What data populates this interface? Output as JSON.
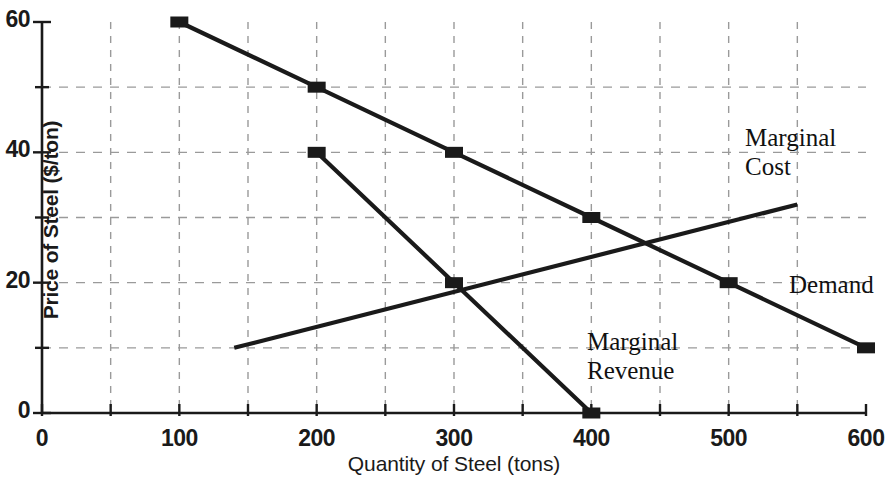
{
  "chart_data": {
    "type": "line",
    "title": "",
    "xlabel": "Quantity of Steel (tons)",
    "ylabel": "Price of Steel ($/ton)",
    "xlim": [
      0,
      600
    ],
    "ylim": [
      0,
      60
    ],
    "x_ticks": [
      0,
      100,
      200,
      300,
      400,
      500,
      600
    ],
    "x_tick_labels": [
      "0",
      "100",
      "200",
      "300",
      "400",
      "500",
      "600"
    ],
    "x_minor_ticks": [
      50,
      150,
      250,
      350,
      450,
      550
    ],
    "y_ticks": [
      0,
      20,
      40,
      60
    ],
    "y_tick_labels": [
      "0",
      "20",
      "40",
      "60"
    ],
    "y_minor_ticks": [
      10,
      30,
      50
    ],
    "grid": true,
    "grid_style": "dashed",
    "grid_x": [
      50,
      100,
      150,
      200,
      250,
      300,
      350,
      400,
      450,
      500,
      550
    ],
    "grid_y": [
      10,
      20,
      30,
      40,
      50
    ],
    "legend_position": "inline-annotations",
    "series": [
      {
        "name": "Demand",
        "marker": "square",
        "x": [
          100,
          200,
          300,
          400,
          500,
          600
        ],
        "values": [
          60,
          50,
          40,
          30,
          20,
          10
        ]
      },
      {
        "name": "Marginal Revenue",
        "marker": "square",
        "x": [
          200,
          300,
          400
        ],
        "values": [
          40,
          20,
          0
        ]
      },
      {
        "name": "Marginal Cost",
        "marker": "none",
        "x": [
          140,
          550
        ],
        "values": [
          10,
          32
        ]
      }
    ],
    "annotations": [
      {
        "text": "Marginal\nCost",
        "x": 515,
        "y": 47
      },
      {
        "text": "Demand",
        "x": 545,
        "y": 21
      },
      {
        "text": "Marginal\nRevenue",
        "x": 398,
        "y": 13
      }
    ]
  },
  "axes": {
    "y_title": "Price of Steel ($/ton)",
    "x_title": "Quantity of Steel (tons)"
  },
  "ticks": {
    "y": [
      {
        "label": "60",
        "value": 60
      },
      {
        "label": "40",
        "value": 40
      },
      {
        "label": "20",
        "value": 20
      },
      {
        "label": "0",
        "value": 0
      }
    ],
    "x": [
      {
        "label": "0",
        "value": 0
      },
      {
        "label": "100",
        "value": 100
      },
      {
        "label": "200",
        "value": 200
      },
      {
        "label": "300",
        "value": 300
      },
      {
        "label": "400",
        "value": 400
      },
      {
        "label": "500",
        "value": 500
      },
      {
        "label": "600",
        "value": 600
      }
    ]
  },
  "labels": {
    "marginal_cost": "Marginal\nCost",
    "demand": "Demand",
    "marginal_revenue": "Marginal\nRevenue"
  },
  "colors": {
    "ink": "#1a1a1a",
    "grid": "#9a9a9a",
    "background": "#ffffff"
  }
}
